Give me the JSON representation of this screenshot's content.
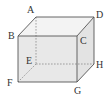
{
  "figure": {
    "type": "cube",
    "vertices": {
      "A": {
        "label": "A",
        "x": 36,
        "y": 17,
        "lx": 27,
        "ly": 13
      },
      "B": {
        "label": "B",
        "x": 18,
        "y": 36,
        "lx": 8,
        "ly": 39
      },
      "C": {
        "label": "C",
        "x": 77,
        "y": 36,
        "lx": 80,
        "ly": 44
      },
      "D": {
        "label": "D",
        "x": 94,
        "y": 17,
        "lx": 96,
        "ly": 17
      },
      "E": {
        "label": "E",
        "x": 36,
        "y": 64,
        "lx": 26,
        "ly": 64
      },
      "F": {
        "label": "F",
        "x": 18,
        "y": 82,
        "lx": 7,
        "ly": 86
      },
      "G": {
        "label": "G",
        "x": 77,
        "y": 82,
        "lx": 74,
        "ly": 93
      },
      "H": {
        "label": "H",
        "x": 94,
        "y": 64,
        "lx": 96,
        "ly": 68
      }
    },
    "colors": {
      "edge": "#555555",
      "hidden_edge": "#8a8a8a",
      "front_face": "#e6e6e6",
      "top_face": "#f2f2f2",
      "side_face": "#e0e0e0"
    }
  }
}
